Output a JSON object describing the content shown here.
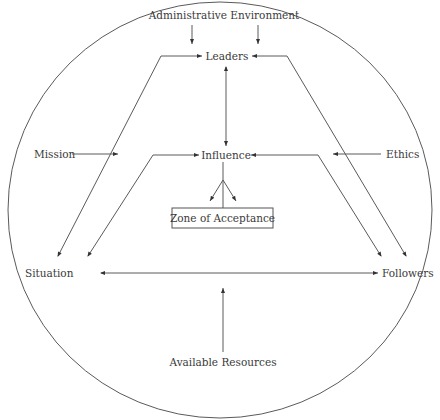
{
  "diagram": {
    "type": "concept-diagram",
    "nodes": {
      "administrative_environment": "Administrative Environment",
      "leaders": "Leaders",
      "mission": "Mission",
      "ethics": "Ethics",
      "influence": "Influence",
      "zone_of_acceptance": "Zone of Acceptance",
      "situation": "Situation",
      "followers": "Followers",
      "available_resources": "Available Resources"
    },
    "edges": [
      {
        "from": "Administrative Environment",
        "to": "Leaders",
        "count": 2
      },
      {
        "from": "Leaders",
        "to": "Influence",
        "bidirectional": true
      },
      {
        "from": "Situation",
        "to": "Leaders"
      },
      {
        "from": "Followers",
        "to": "Leaders"
      },
      {
        "from": "Situation",
        "to": "Influence"
      },
      {
        "from": "Followers",
        "to": "Influence"
      },
      {
        "from": "Influence",
        "to": "Zone of Acceptance"
      },
      {
        "from": "Mission",
        "to": "Situation-Leaders path"
      },
      {
        "from": "Ethics",
        "to": "Followers-Leaders path"
      },
      {
        "from": "Situation",
        "to": "Followers",
        "bidirectional": true
      },
      {
        "from": "Available Resources",
        "to": "Situation-Followers line"
      }
    ],
    "colors": {
      "line": "#5a5a5a",
      "text": "#3a3a3a",
      "background": "#ffffff"
    }
  }
}
